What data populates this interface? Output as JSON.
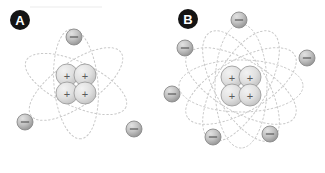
{
  "figure": {
    "width": 325,
    "height": 173,
    "background": "#ffffff",
    "artifact_line": {
      "name": "faint-rule",
      "x": 30,
      "y": 7,
      "width": 72,
      "color": "#ececec"
    }
  },
  "colors": {
    "badge_fill": "#141414",
    "badge_text": "#ffffff",
    "orbit_stroke": "#c9c9c9",
    "electron_fill_light": "#d8d8d8",
    "electron_fill_dark": "#9a9a9a",
    "electron_stroke": "#8a8a8a",
    "proton_fill_light": "#e6e6e6",
    "proton_fill_dark": "#bdbdbd",
    "proton_stroke": "#9e9e9e",
    "sign_color": "#5a5a5a"
  },
  "panels": [
    {
      "id": "panel-a",
      "label": "A",
      "badge": {
        "cx": 20,
        "cy": 20,
        "r": 10
      },
      "nucleus": {
        "cx": 76,
        "cy": 84,
        "particle_r": 11,
        "particle_sign": "+",
        "particle_count": 4,
        "particles": [
          {
            "cx": -9,
            "cy": -9
          },
          {
            "cx": 9,
            "cy": -9
          },
          {
            "cx": -9,
            "cy": 9
          },
          {
            "cx": 9,
            "cy": 9
          }
        ]
      },
      "orbits": [
        {
          "rx": 55,
          "ry": 22,
          "rotate": 25
        },
        {
          "rx": 55,
          "ry": 22,
          "rotate": 85
        },
        {
          "rx": 55,
          "ry": 22,
          "rotate": 145
        }
      ],
      "electrons": [
        {
          "cx": 74,
          "cy": 37,
          "r": 8,
          "sign": "−"
        },
        {
          "cx": 25,
          "cy": 122,
          "r": 8,
          "sign": "−"
        },
        {
          "cx": 134,
          "cy": 129,
          "r": 8,
          "sign": "−"
        }
      ],
      "electron_count": 3,
      "proton_count": 4
    },
    {
      "id": "panel-b",
      "label": "B",
      "badge": {
        "cx": 188,
        "cy": 19,
        "r": 10
      },
      "nucleus": {
        "cx": 241,
        "cy": 86,
        "particle_r": 11,
        "particle_sign": "+",
        "particle_count": 4,
        "particles": [
          {
            "cx": -9,
            "cy": -9
          },
          {
            "cx": 9,
            "cy": -9
          },
          {
            "cx": -9,
            "cy": 9
          },
          {
            "cx": 9,
            "cy": 9
          }
        ]
      },
      "orbits": [
        {
          "rx": 62,
          "ry": 26,
          "rotate": 0
        },
        {
          "rx": 62,
          "ry": 26,
          "rotate": 30
        },
        {
          "rx": 62,
          "ry": 26,
          "rotate": 60
        },
        {
          "rx": 62,
          "ry": 26,
          "rotate": 90
        },
        {
          "rx": 62,
          "ry": 26,
          "rotate": 120
        },
        {
          "rx": 62,
          "ry": 26,
          "rotate": 150
        }
      ],
      "electrons": [
        {
          "cx": 239,
          "cy": 20,
          "r": 8,
          "sign": "−"
        },
        {
          "cx": 185,
          "cy": 48,
          "r": 8,
          "sign": "−"
        },
        {
          "cx": 307,
          "cy": 58,
          "r": 8,
          "sign": "−"
        },
        {
          "cx": 172,
          "cy": 94,
          "r": 8,
          "sign": "−"
        },
        {
          "cx": 213,
          "cy": 137,
          "r": 8,
          "sign": "−"
        },
        {
          "cx": 270,
          "cy": 134,
          "r": 8,
          "sign": "−"
        }
      ],
      "electron_count": 6,
      "proton_count": 4
    }
  ]
}
